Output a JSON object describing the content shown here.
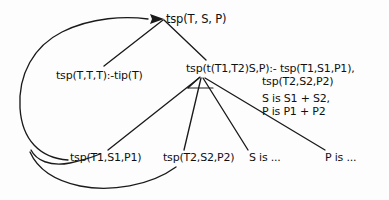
{
  "diagram": {
    "background_color": "#fdfdfd",
    "ink_color": "#1a1a1a",
    "nodes": {
      "root": "tsp(T, S, P)",
      "base_clause": "tsp(T,T,T):-tip(T)",
      "recursive_clause_head": "tsp(t(T1,T2)S,P):- tsp(T1,S1,P1),",
      "recursive_clause_body2": "tsp(T2,S2,P2)",
      "recursive_clause_sum_s": "S is S1 + S2,",
      "recursive_clause_sum_p": "P is P1 + P2",
      "goal_t1": "tsp(T1,S1,P1)",
      "goal_t2": "tsp(T2,S2,P2)",
      "goal_s": "S is ...",
      "goal_p": "P is ..."
    },
    "edges": [
      {
        "name": "root-to-base-clause",
        "from": "root",
        "to": "base_clause",
        "style": "straight"
      },
      {
        "name": "root-to-recursive-clause",
        "from": "root",
        "to": "recursive_clause_head",
        "style": "straight"
      },
      {
        "name": "recursive-to-goal-t1",
        "from": "recursive_clause_head",
        "to": "goal_t1",
        "style": "straight"
      },
      {
        "name": "recursive-to-goal-t2",
        "from": "recursive_clause_head",
        "to": "goal_t2",
        "style": "straight"
      },
      {
        "name": "recursive-to-goal-s",
        "from": "recursive_clause_head",
        "to": "goal_s",
        "style": "straight"
      },
      {
        "name": "recursive-to-goal-p",
        "from": "recursive_clause_head",
        "to": "goal_p",
        "style": "straight"
      },
      {
        "name": "goal-t1-backedge-to-root",
        "from": "goal_t1",
        "to": "root",
        "style": "curved-backedge"
      },
      {
        "name": "goal-t2-backedge-to-root",
        "from": "goal_t2",
        "to": "root",
        "style": "curved-backedge"
      }
    ],
    "arrowheads": [
      {
        "name": "root-incoming-arrowhead",
        "target": "root",
        "direction": "right"
      }
    ]
  }
}
